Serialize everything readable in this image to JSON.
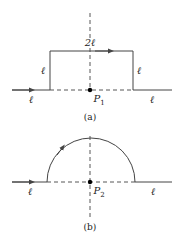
{
  "figure_a": {
    "caption": "(a)",
    "point_label": "P",
    "point_sub": "1",
    "labels": {
      "top": "2ℓ",
      "left_side": "ℓ",
      "right_side": "ℓ",
      "left_wire": "ℓ",
      "right_wire": "ℓ"
    }
  },
  "figure_b": {
    "caption": "(b)",
    "point_label": "P",
    "point_sub": "2",
    "labels": {
      "left_wire": "ℓ",
      "right_wire": "ℓ"
    }
  },
  "colors": {
    "line": "#444444",
    "dash": "#444444",
    "dot": "#000000"
  }
}
